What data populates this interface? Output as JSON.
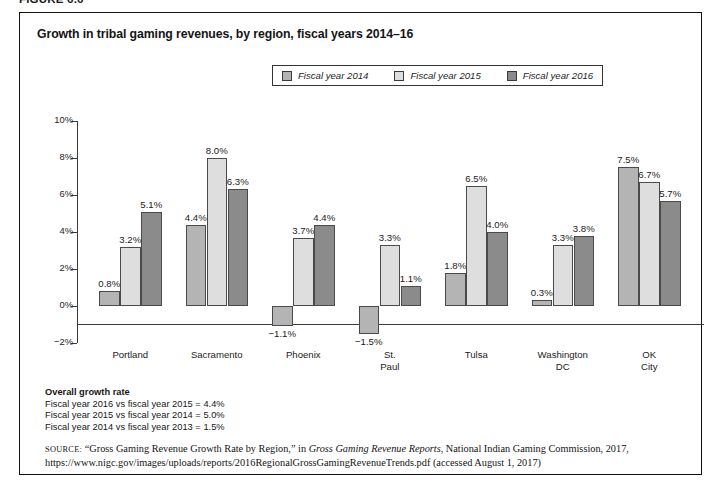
{
  "figure": {
    "label": "FIGURE 6.6",
    "title": "Growth in tribal gaming revenues, by region, fiscal years 2014–16"
  },
  "legend": {
    "items": [
      {
        "label": "Fiscal year 2014",
        "color": "#b4b4b4"
      },
      {
        "label": "Fiscal year 2015",
        "color": "#dedede"
      },
      {
        "label": "Fiscal year 2016",
        "color": "#8b8b8b"
      }
    ]
  },
  "axis": {
    "tick_labels": [
      "10%",
      "8%",
      "6%",
      "4%",
      "2%",
      "0%",
      "−2%"
    ]
  },
  "notes": {
    "overall_heading": "Overall growth rate",
    "lines": [
      "Fiscal year 2016 vs fiscal year 2015 = 4.4%",
      "Fiscal year 2015 vs fiscal year 2014 = 5.0%",
      "Fiscal year 2014 vs fiscal year 2013 = 1.5%"
    ]
  },
  "source": {
    "prefix": "SOURCE:",
    "text_1": " “Gross Gaming Revenue Growth  Rate by Region,” in ",
    "italic_1": "Gross Gaming Revenue Reports",
    "text_2": ", National Indian Gaming Commission, 2017,",
    "url": "https://www.nigc.gov/images/uploads/reports/2016RegionalGrossGamingRevenueTrends.pdf (accessed August 1, 2017)"
  },
  "chart_data": {
    "type": "bar",
    "title": "Growth in tribal gaming revenues, by region, fiscal years 2014–16",
    "xlabel": "",
    "ylabel": "",
    "ylim": [
      -2,
      10
    ],
    "ytick_values": [
      10,
      8,
      6,
      4,
      2,
      0,
      -2
    ],
    "ytick_labels": [
      "10%",
      "8%",
      "6%",
      "4%",
      "2%",
      "0%",
      "−2%"
    ],
    "grid": false,
    "legend_position": "top-center",
    "categories": [
      "Portland",
      "Sacramento",
      "Phoenix",
      "St. Paul",
      "Tulsa",
      "Washington DC",
      "OK City"
    ],
    "series": [
      {
        "name": "Fiscal year 2014",
        "color": "#b4b4b4",
        "values": [
          0.8,
          4.4,
          -1.1,
          -1.5,
          1.8,
          0.3,
          7.5
        ],
        "labels": [
          "0.8%",
          "4.4%",
          "−1.1%",
          "−1.5%",
          "1.8%",
          "0.3%",
          "7.5%"
        ]
      },
      {
        "name": "Fiscal year 2015",
        "color": "#dedede",
        "values": [
          3.2,
          8.0,
          3.7,
          3.3,
          6.5,
          3.3,
          6.7
        ],
        "labels": [
          "3.2%",
          "8.0%",
          "3.7%",
          "3.3%",
          "6.5%",
          "3.3%",
          "6.7%"
        ]
      },
      {
        "name": "Fiscal year 2016",
        "color": "#8b8b8b",
        "values": [
          5.1,
          6.3,
          4.4,
          1.1,
          4.0,
          3.8,
          5.7
        ],
        "labels": [
          "5.1%",
          "6.3%",
          "4.4%",
          "1.1%",
          "4.0%",
          "3.8%",
          "5.7%"
        ]
      }
    ],
    "annotations": [
      "Overall growth rate",
      "Fiscal year 2016 vs fiscal year 2015 = 4.4%",
      "Fiscal year 2015 vs fiscal year 2014 = 5.0%",
      "Fiscal year 2014 vs fiscal year 2013 = 1.5%"
    ]
  }
}
